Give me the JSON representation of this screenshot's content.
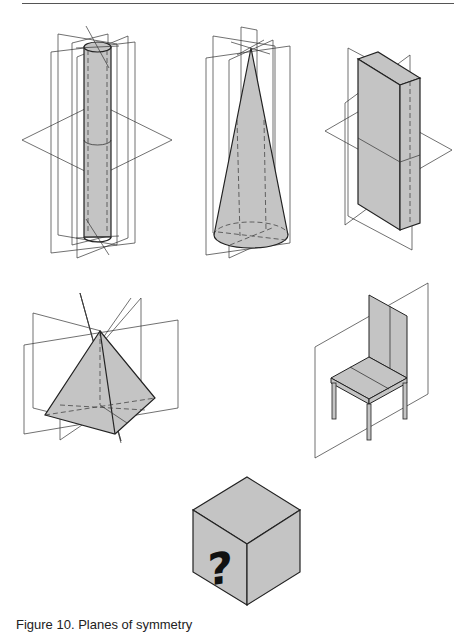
{
  "page": {
    "caption": "Figure 10. Planes of symmetry"
  },
  "figures": [
    {
      "id": "cylinder",
      "label": "Cylinder with planes of symmetry"
    },
    {
      "id": "cone",
      "label": "Cone with planes of symmetry"
    },
    {
      "id": "rectangular-prism",
      "label": "Rectangular prism with planes of symmetry"
    },
    {
      "id": "square-pyramid",
      "label": "Square pyramid with planes of symmetry"
    },
    {
      "id": "chair",
      "label": "Chair with plane of symmetry"
    },
    {
      "id": "mystery-cube",
      "label": "Cube with question mark",
      "glyph": "?"
    }
  ],
  "colors": {
    "fill": "#c4c4c4",
    "stroke": "#222222",
    "plane": "#333333"
  }
}
